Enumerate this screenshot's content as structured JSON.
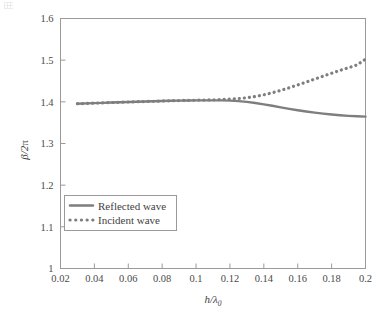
{
  "chart_data": {
    "type": "line",
    "title": "",
    "xlabel": "h/λ₀",
    "ylabel": "β/2π",
    "xlabel_parts": {
      "numerator": "h",
      "denominator": "λ",
      "subscript": "0"
    },
    "ylabel_parts": {
      "numerator": "β",
      "denominator": "2π"
    },
    "xlim": [
      0.02,
      0.2
    ],
    "ylim": [
      1.0,
      1.6
    ],
    "xticks": [
      0.02,
      0.04,
      0.06,
      0.08,
      0.1,
      0.12,
      0.14,
      0.16,
      0.18,
      0.2
    ],
    "xtick_labels": [
      "0.02",
      "0.04",
      "0.06",
      "0.08",
      "0.1",
      "0.12",
      "0.14",
      "0.16",
      "0.18",
      "0.2"
    ],
    "yticks": [
      1.0,
      1.1,
      1.2,
      1.3,
      1.4,
      1.5,
      1.6
    ],
    "ytick_labels": [
      "1",
      "1.1",
      "1.2",
      "1.3",
      "1.4",
      "1.5",
      "1.6"
    ],
    "grid": false,
    "legend_position": "lower-left",
    "line_color": "#7e7e7e",
    "frame_color": "#9a9a9a",
    "background": "#ffffff",
    "x": [
      0.03,
      0.035,
      0.04,
      0.045,
      0.05,
      0.055,
      0.06,
      0.065,
      0.07,
      0.075,
      0.08,
      0.085,
      0.09,
      0.095,
      0.1,
      0.105,
      0.11,
      0.115,
      0.12,
      0.125,
      0.13,
      0.135,
      0.14,
      0.145,
      0.15,
      0.155,
      0.16,
      0.165,
      0.17,
      0.175,
      0.18,
      0.185,
      0.19,
      0.195,
      0.2
    ],
    "series": [
      {
        "name": "Reflected wave",
        "style": "solid",
        "color": "#7e7e7e",
        "width": 2.4,
        "values": [
          1.3955,
          1.3962,
          1.3969,
          1.3976,
          1.3983,
          1.399,
          1.3996,
          1.4002,
          1.4008,
          1.4014,
          1.402,
          1.4026,
          1.403,
          1.4033,
          1.4035,
          1.4036,
          1.4036,
          1.4034,
          1.4028,
          1.4016,
          1.3998,
          1.3972,
          1.394,
          1.3905,
          1.3868,
          1.3832,
          1.3798,
          1.3768,
          1.374,
          1.3716,
          1.3695,
          1.3678,
          1.3664,
          1.3653,
          1.3645
        ]
      },
      {
        "name": "Incident wave",
        "style": "dotted",
        "color": "#7e7e7e",
        "width": 3.2,
        "values": [
          1.3955,
          1.3962,
          1.3969,
          1.3976,
          1.3983,
          1.399,
          1.3996,
          1.4002,
          1.4008,
          1.4014,
          1.402,
          1.4026,
          1.4031,
          1.4035,
          1.4039,
          1.4043,
          1.4048,
          1.4055,
          1.4064,
          1.4078,
          1.4098,
          1.4128,
          1.4168,
          1.4218,
          1.4275,
          1.4338,
          1.4405,
          1.4474,
          1.4545,
          1.4616,
          1.4686,
          1.4754,
          1.482,
          1.4885,
          1.5025
        ]
      }
    ],
    "legend_entries": [
      {
        "label": "Reflected wave",
        "style": "solid"
      },
      {
        "label": "Incident wave",
        "style": "dotted"
      }
    ]
  }
}
